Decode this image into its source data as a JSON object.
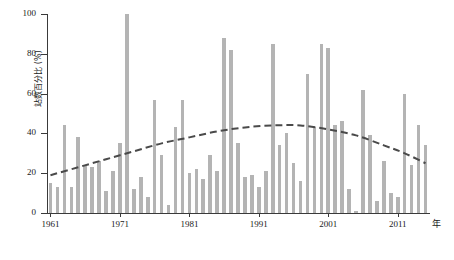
{
  "chart_data": {
    "type": "bar",
    "title": "",
    "subtitle": "",
    "xlabel": "年",
    "ylabel": "站数百分比 (%)",
    "ylim": [
      0,
      100
    ],
    "xlim": [
      1961,
      2015
    ],
    "yticks": [
      0,
      20,
      40,
      60,
      80,
      100
    ],
    "xticks": [
      1961,
      1971,
      1981,
      1991,
      2001,
      2011
    ],
    "grid": false,
    "legend": null,
    "bar_color": "#b4b4b4",
    "trend_color": "#4a4a4a",
    "trend_style": "dashed",
    "categories": [
      "1961",
      "1962",
      "1963",
      "1964",
      "1965",
      "1966",
      "1967",
      "1968",
      "1969",
      "1970",
      "1971",
      "1972",
      "1973",
      "1974",
      "1975",
      "1976",
      "1977",
      "1978",
      "1979",
      "1980",
      "1981",
      "1982",
      "1983",
      "1984",
      "1985",
      "1986",
      "1987",
      "1988",
      "1989",
      "1990",
      "1991",
      "1992",
      "1993",
      "1994",
      "1995",
      "1996",
      "1997",
      "1998",
      "1999",
      "2000",
      "2001",
      "2002",
      "2003",
      "2004",
      "2005",
      "2006",
      "2007",
      "2008",
      "2009",
      "2010",
      "2011",
      "2012",
      "2013",
      "2014",
      "2015"
    ],
    "values": [
      15,
      13,
      44,
      13,
      38,
      24,
      23,
      26,
      11,
      21,
      35,
      100,
      12,
      18,
      8,
      57,
      29,
      4,
      43,
      57,
      20,
      22,
      17,
      29,
      21,
      88,
      82,
      35,
      18,
      19,
      13,
      21,
      85,
      34,
      40,
      25,
      16,
      70,
      43,
      85,
      83,
      44,
      46,
      12,
      1,
      62,
      39,
      6,
      26,
      10,
      8,
      60,
      24,
      44,
      34
    ],
    "trend": {
      "type": "polynomial",
      "description": "dashed quadratic trend curve",
      "points": [
        {
          "x": 1961,
          "y": 19
        },
        {
          "x": 1965,
          "y": 23
        },
        {
          "x": 1969,
          "y": 27
        },
        {
          "x": 1973,
          "y": 31
        },
        {
          "x": 1977,
          "y": 35
        },
        {
          "x": 1981,
          "y": 38
        },
        {
          "x": 1985,
          "y": 41
        },
        {
          "x": 1989,
          "y": 43
        },
        {
          "x": 1993,
          "y": 44
        },
        {
          "x": 1997,
          "y": 44
        },
        {
          "x": 2001,
          "y": 42
        },
        {
          "x": 2005,
          "y": 39
        },
        {
          "x": 2009,
          "y": 34
        },
        {
          "x": 2012,
          "y": 30
        },
        {
          "x": 2015,
          "y": 25
        }
      ]
    }
  }
}
